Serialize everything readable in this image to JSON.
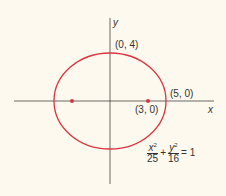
{
  "diagram": {
    "axes": {
      "x_label": "x",
      "y_label": "y"
    },
    "ellipse": {
      "color": "#d9343f",
      "a": 5,
      "b": 4
    },
    "points": [
      {
        "label": "(0, 4)"
      },
      {
        "label": "(5, 0)"
      },
      {
        "label": "(3, 0)"
      }
    ],
    "equation": {
      "num1": "x",
      "num1_exp": "2",
      "den1": "25",
      "plus": "+",
      "num2": "y",
      "num2_exp": "2",
      "den2": "16",
      "rhs": "= 1"
    }
  }
}
